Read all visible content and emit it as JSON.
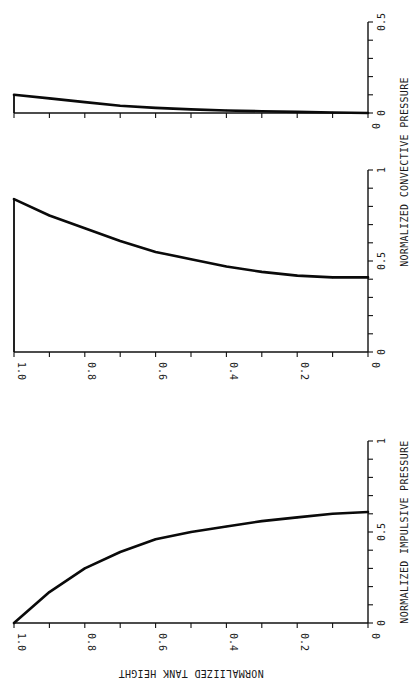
{
  "chart_data": {
    "type": "line",
    "orientation": "rotated-90-ccw",
    "shared_axis_label": "NORMALIIZED TANK HEIGHT",
    "shared_axis_ticks": [
      "1.0",
      "0.8",
      "0.6",
      "0.4",
      "0.2",
      "0"
    ],
    "shared_axis_range": [
      1.0,
      0
    ],
    "panels": [
      {
        "id": "impulsive",
        "ylabel": "NORMALIZED IMPULSIVE PRESSURE",
        "ylim": [
          0,
          1
        ],
        "tick_labels": [
          "0",
          "0.5",
          "1"
        ],
        "tick_values": [
          0,
          0.5,
          1
        ],
        "minor_tick_step": 0.1,
        "series": [
          {
            "name": "impulsive pressure",
            "x": [
              1.0,
              0.9,
              0.8,
              0.7,
              0.6,
              0.5,
              0.4,
              0.3,
              0.2,
              0.1,
              0.0
            ],
            "y": [
              0.0,
              0.17,
              0.3,
              0.39,
              0.46,
              0.5,
              0.53,
              0.56,
              0.58,
              0.6,
              0.61
            ]
          }
        ],
        "closed_top": false,
        "shows_x_tick_labels": true
      },
      {
        "id": "convective",
        "ylabel": "NORMALIZED CONVECTIVE PRESSURE",
        "ylim": [
          0,
          1
        ],
        "tick_labels": [
          "0",
          "0.5",
          "1"
        ],
        "tick_values": [
          0,
          0.5,
          1
        ],
        "minor_tick_step": 0.1,
        "series": [
          {
            "name": "convective pressure (mode 1)",
            "x": [
              1.0,
              0.9,
              0.8,
              0.7,
              0.6,
              0.5,
              0.4,
              0.3,
              0.2,
              0.1,
              0.0
            ],
            "y": [
              0.84,
              0.75,
              0.68,
              0.61,
              0.55,
              0.51,
              0.47,
              0.44,
              0.42,
              0.41,
              0.41
            ]
          }
        ],
        "closed_top": true,
        "shows_x_tick_labels": true
      },
      {
        "id": "convective-mode2",
        "ylabel": "",
        "ylim": [
          0,
          0.5
        ],
        "tick_labels": [
          "0",
          "0.5"
        ],
        "tick_values": [
          0,
          0.5
        ],
        "minor_tick_step": 0.1,
        "series": [
          {
            "name": "convective pressure (mode 2)",
            "x": [
              1.0,
              0.9,
              0.8,
              0.7,
              0.6,
              0.5,
              0.4,
              0.3,
              0.2,
              0.1,
              0.0
            ],
            "y": [
              0.1,
              0.08,
              0.06,
              0.04,
              0.028,
              0.02,
              0.014,
              0.01,
              0.006,
              0.003,
              0.0
            ]
          }
        ],
        "closed_top": true,
        "shows_x_tick_labels": false,
        "shows_zero_only": true
      }
    ]
  }
}
